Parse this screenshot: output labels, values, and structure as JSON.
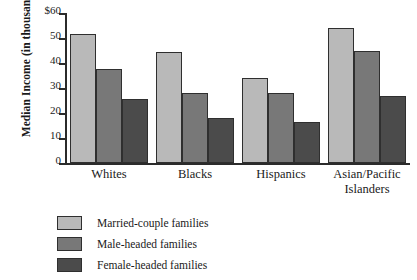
{
  "chart_data": {
    "type": "bar",
    "title": "",
    "xlabel": "",
    "ylabel": "Median Income (in thousands)",
    "ylim": [
      0,
      60
    ],
    "yticks": [
      0,
      10,
      20,
      30,
      40,
      50,
      60
    ],
    "ytick_labels": [
      "0",
      "10",
      "20",
      "30",
      "40",
      "50",
      "$60"
    ],
    "grid": false,
    "legend_position": "below-left",
    "categories": [
      "Whites",
      "Blacks",
      "Hispanics",
      "Asian/Pacific Islanders"
    ],
    "series": [
      {
        "name": "Married-couple families",
        "color": "#b9b9b9",
        "values": [
          51.5,
          44.5,
          34,
          54
        ]
      },
      {
        "name": "Male-headed families",
        "color": "#787878",
        "values": [
          37.5,
          28,
          28,
          45
        ]
      },
      {
        "name": "Female-headed families",
        "color": "#4b4b4b",
        "values": [
          25.5,
          18,
          16.5,
          27
        ]
      }
    ]
  },
  "axis": {
    "y_title": "Median Income (in thousands)"
  },
  "categories_display": [
    "Whites",
    "Blacks",
    "Hispanics",
    "Asian/Pacific\nIslanders"
  ],
  "legend": {
    "items": [
      {
        "label": "Married-couple families",
        "color": "#b9b9b9"
      },
      {
        "label": "Male-headed families",
        "color": "#787878"
      },
      {
        "label": "Female-headed families",
        "color": "#4b4b4b"
      }
    ]
  }
}
